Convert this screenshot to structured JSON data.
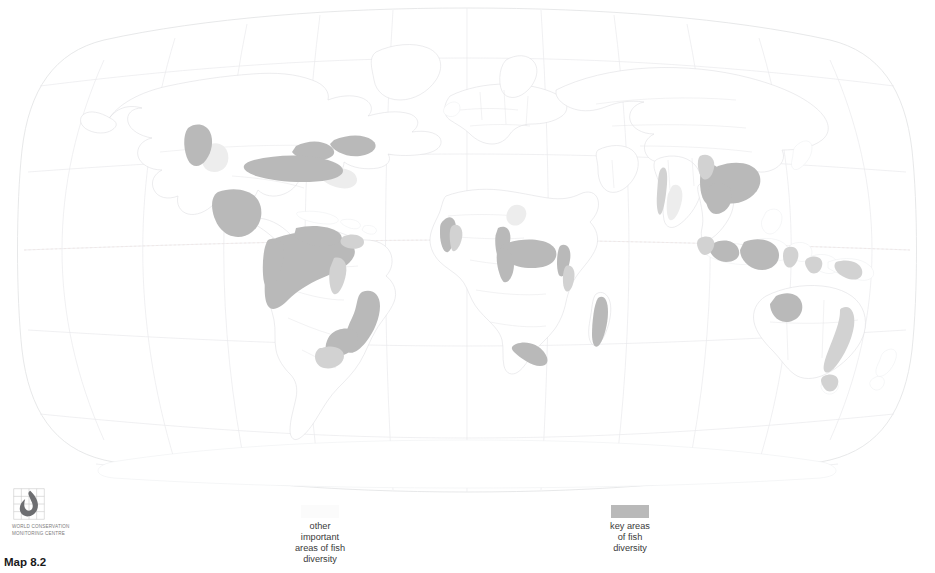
{
  "figure": {
    "caption": "Map 8.2",
    "projection": "robinson",
    "background_color": "#ffffff"
  },
  "legend": {
    "items": [
      {
        "id": "other-important-areas",
        "label": "other\nimportant\nareas of fish\ndiversity",
        "swatch_color": "#fbfbfb"
      },
      {
        "id": "key-areas",
        "label": "key areas\nof fish\ndiversity",
        "swatch_color": "#b9b9b9"
      }
    ]
  },
  "logo": {
    "name": "world-conservation-monitoring-centre",
    "organisation": "WORLD CONSERVATION\nMONITORING CENTRE",
    "mark_color": "#6d6e71"
  },
  "map": {
    "land_outline_color": "#dcdddf",
    "border_color": "#e2e3e5",
    "graticule_color": "#e9eaec",
    "equator_color": "#efe6e4",
    "key_area_color": "#b9b9b9",
    "other_area_color": "#ededed",
    "key_regions": [
      "Pacific Northwest",
      "Southeastern United States",
      "Appalachian rivers",
      "Mississippi basin",
      "Mexico",
      "Amazon basin",
      "Orinoco basin",
      "Guianas",
      "Paraná / southeast Brazil",
      "Upper Guinea coast",
      "Congo basin",
      "Lake Tanganyika",
      "Lake Malawi",
      "Madagascar",
      "Cape region of South Africa",
      "Western Ghats",
      "Mekong basin",
      "Myanmar rivers",
      "Sumatra",
      "Borneo",
      "Sulawesi",
      "New Guinea",
      "Kimberley, northwest Australia",
      "Eastern Australia"
    ]
  }
}
